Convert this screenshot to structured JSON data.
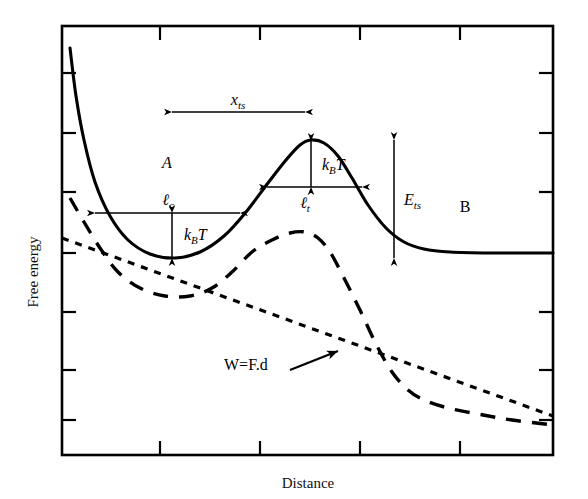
{
  "figure": {
    "axes": {
      "ylabel": "Free energy",
      "xlabel": "Distance",
      "x_ticks_px": [
        160,
        260,
        360,
        460
      ],
      "y_ticks_px": [
        73,
        133,
        192,
        253,
        312,
        370,
        420
      ],
      "frame_px": {
        "left": 62,
        "top": 26,
        "right": 553,
        "bottom": 455
      },
      "tick_labels": [],
      "grid": false
    },
    "annotations": {
      "x_ts": {
        "base": "x",
        "sub": "ts",
        "italic": true
      },
      "state_a": {
        "label": "A",
        "italic": true
      },
      "state_b": {
        "label": "B",
        "italic": false
      },
      "l_c": {
        "base": "ℓ",
        "sub": "c"
      },
      "l_t": {
        "base": "ℓ",
        "sub": "t"
      },
      "kbt_well": {
        "base": "k",
        "sub": "B",
        "tail": "T"
      },
      "kbt_barrier": {
        "base": "k",
        "sub": "B",
        "tail": "T"
      },
      "e_ts": {
        "base": "E",
        "sub": "ts",
        "italic": true
      },
      "work": {
        "label": "W=F.d"
      }
    },
    "colors": {
      "ink": "#000000",
      "background": "#ffffff",
      "axis": "#000000"
    },
    "curves": {
      "unperturbed_label": "solid: unperturbed free-energy landscape",
      "tilted_label": "long-dashed: tilted landscape under applied force",
      "work_label": "short-dotted: mechanical work W=F.d"
    }
  },
  "chart_data": {
    "type": "line",
    "title": "",
    "xlabel": "Distance",
    "ylabel": "Free energy",
    "xlim": [
      0,
      1
    ],
    "ylim": [
      0,
      1
    ],
    "grid": false,
    "legend": null,
    "series": [
      {
        "name": "Free-energy landscape (unperturbed)",
        "style": "solid",
        "points_px": [
          [
            70,
            48
          ],
          [
            76,
            96
          ],
          [
            84,
            140
          ],
          [
            95,
            182
          ],
          [
            110,
            216
          ],
          [
            128,
            240
          ],
          [
            150,
            254
          ],
          [
            175,
            258
          ],
          [
            200,
            252
          ],
          [
            224,
            236
          ],
          [
            246,
            212
          ],
          [
            268,
            183
          ],
          [
            286,
            160
          ],
          [
            300,
            145
          ],
          [
            311,
            140
          ],
          [
            324,
            143
          ],
          [
            338,
            156
          ],
          [
            352,
            178
          ],
          [
            368,
            205
          ],
          [
            386,
            228
          ],
          [
            404,
            242
          ],
          [
            424,
            249
          ],
          [
            450,
            252
          ],
          [
            490,
            253
          ],
          [
            553,
            253
          ]
        ]
      },
      {
        "name": "Tilted landscape under force",
        "style": "long-dashed",
        "points_px": [
          [
            70,
            198
          ],
          [
            84,
            222
          ],
          [
            100,
            248
          ],
          [
            118,
            272
          ],
          [
            140,
            288
          ],
          [
            165,
            296
          ],
          [
            190,
            296
          ],
          [
            212,
            288
          ],
          [
            232,
            272
          ],
          [
            252,
            252
          ],
          [
            272,
            240
          ],
          [
            290,
            233
          ],
          [
            305,
            232
          ],
          [
            318,
            238
          ],
          [
            330,
            252
          ],
          [
            344,
            278
          ],
          [
            360,
            310
          ],
          [
            376,
            344
          ],
          [
            392,
            372
          ],
          [
            408,
            390
          ],
          [
            424,
            400
          ],
          [
            448,
            408
          ],
          [
            478,
            414
          ],
          [
            512,
            420
          ],
          [
            553,
            425
          ]
        ]
      },
      {
        "name": "Mechanical work W=F.d",
        "style": "short-dotted",
        "points_px": [
          [
            62,
            238
          ],
          [
            553,
            416
          ]
        ]
      }
    ],
    "measurement_arrows": [
      {
        "name": "x_ts",
        "type": "double-horizontal",
        "x1": 172,
        "x2": 305,
        "y": 112
      },
      {
        "name": "l_c",
        "type": "double-horizontal",
        "x1": 95,
        "x2": 240,
        "y": 213
      },
      {
        "name": "l_t",
        "type": "double-horizontal",
        "x1": 267,
        "x2": 362,
        "y": 187
      },
      {
        "name": "kBT_well",
        "type": "double-vertical",
        "x": 172,
        "y1": 213,
        "y2": 258
      },
      {
        "name": "kBT_barrier",
        "type": "double-vertical",
        "x": 311,
        "y1": 141,
        "y2": 187
      },
      {
        "name": "E_ts",
        "type": "double-vertical",
        "x": 394,
        "y1": 140,
        "y2": 258
      },
      {
        "name": "work_pointer",
        "type": "single-arrow",
        "x1": 290,
        "y1": 370,
        "x2": 341,
        "y2": 349
      }
    ]
  }
}
